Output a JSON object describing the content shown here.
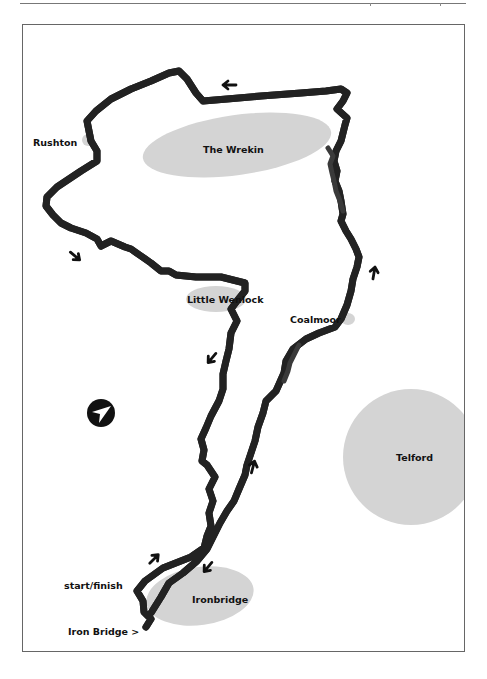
{
  "page": {
    "header_rule": true
  },
  "map": {
    "colors": {
      "background": "#ffffff",
      "frame": "#666666",
      "area_fill": "#d4d4d4",
      "route_outline": "#222222",
      "route_fill": "#ffffff",
      "busy_road": "#3a3a3a",
      "arrow": "#111111",
      "compass": "#111111"
    },
    "places": [
      {
        "id": "the-wrekin",
        "label": "The Wrekin",
        "shape": "ellipse"
      },
      {
        "id": "rushton",
        "label": "Rushton",
        "shape": "small-ellipse"
      },
      {
        "id": "little-wenlock",
        "label": "Little Wenlock",
        "shape": "ellipse"
      },
      {
        "id": "coalmoor",
        "label": "Coalmoor",
        "shape": "small-ellipse"
      },
      {
        "id": "telford",
        "label": "Telford",
        "shape": "circle"
      },
      {
        "id": "ironbridge",
        "label": "Ironbridge",
        "shape": "ellipse"
      }
    ],
    "annotations": {
      "start_finish": "start/finish",
      "iron_bridge": "Iron Bridge >"
    },
    "direction_arrows": [
      {
        "id": "arrow-top",
        "direction": "west"
      },
      {
        "id": "arrow-left",
        "direction": "south-east"
      },
      {
        "id": "arrow-wenlock",
        "direction": "south-west"
      },
      {
        "id": "arrow-coalmoor",
        "direction": "north"
      },
      {
        "id": "arrow-middle",
        "direction": "north"
      },
      {
        "id": "arrow-start",
        "direction": "north-east"
      },
      {
        "id": "arrow-ironbridge",
        "direction": "south-west"
      }
    ],
    "compass": {
      "points": "north-east"
    }
  }
}
